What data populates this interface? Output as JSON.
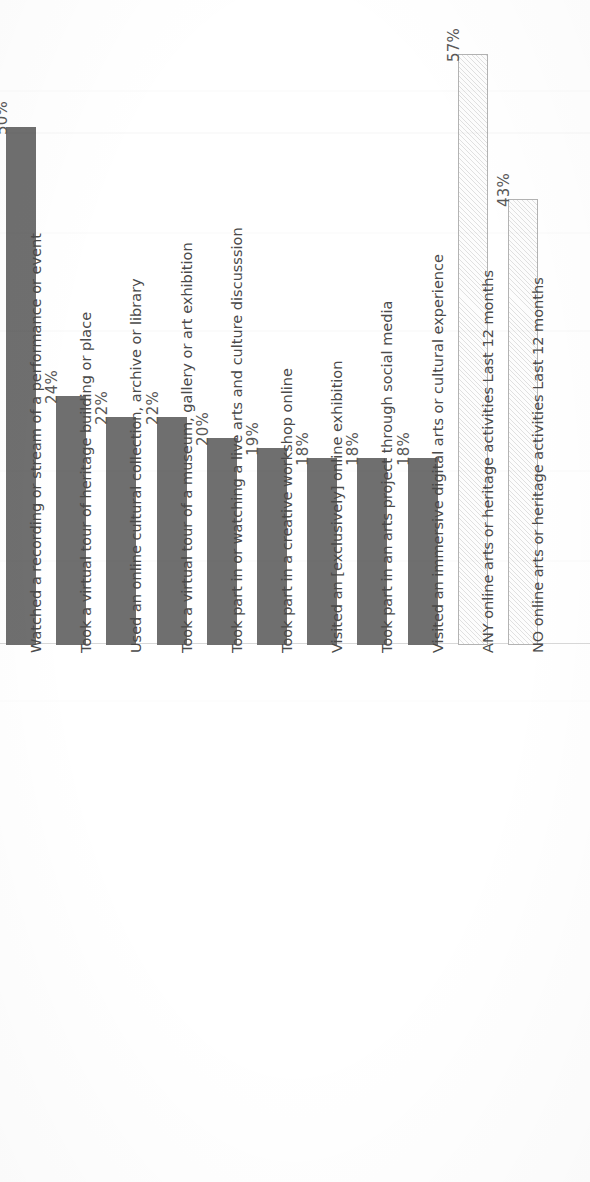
{
  "chart_data": {
    "type": "bar",
    "title": "",
    "subtitle": "",
    "xlabel": "",
    "ylabel": "",
    "orientation": "vertical-bars-rotated-90ccw",
    "grid": false,
    "legend": null,
    "ylim": [
      0,
      60
    ],
    "value_suffix": "%",
    "categories": [
      "Watched a recording or stream of a performance or event",
      "Took a virtual tour of heritage building or place",
      "Used an online cultural collection, archive or library",
      "Took a virtual tour of a museum, gallery or art exhibition",
      "Took part in or watching a live arts and culture discusssion",
      "Took part in a creative workshop online",
      "Visited an [exclusively] online exhibition",
      "Took part in an arts project through social media",
      "Visited an immersive digital arts or cultural experience",
      "ANY online arts or heritage activities Last 12 months",
      "NO online arts or heritage activities Last 12 months"
    ],
    "values": [
      50,
      24,
      22,
      22,
      20,
      19,
      18,
      18,
      18,
      57,
      43
    ],
    "value_labels": [
      "50%",
      "24%",
      "22%",
      "22%",
      "20%",
      "19%",
      "18%",
      "18%",
      "18%",
      "57%",
      "43%"
    ],
    "bar_styles": [
      "solid",
      "solid",
      "solid",
      "solid",
      "solid",
      "solid",
      "solid",
      "solid",
      "solid",
      "hatch",
      "hatch"
    ],
    "colors": {
      "bar_solid": "#6f6f6f",
      "bar_hatch_fill": "#fdfdfd",
      "bar_hatch_edge": "#b3b3b3",
      "baseline": "#d8d8d8",
      "value_text": "#595959",
      "category_text": "#4a4a4a",
      "background": "#ffffff"
    }
  }
}
